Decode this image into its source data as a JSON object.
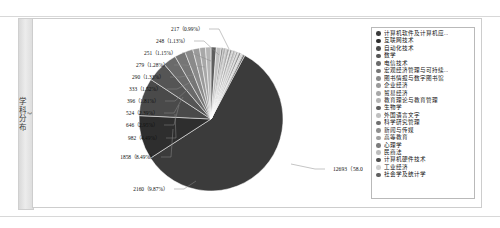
{
  "sidebar": {
    "tab_label": "学科分布",
    "tab_chevrons": "》"
  },
  "chart_data": {
    "type": "pie",
    "title": "",
    "legend_position": "right",
    "label_format": "count (percent)",
    "total": 21882,
    "categories": [
      "计算机软件及计算机应...",
      "互联网技术",
      "自动化技术",
      "数学",
      "电信技术",
      "宏观经济管理与可持续...",
      "图书情报与数字图书馆",
      "企业经济",
      "贸易经济",
      "教育理论与教育管理",
      "生物学",
      "外国语言文字",
      "科学研究管理",
      "新闻与传媒",
      "高等教育",
      "心理学",
      "民商法",
      "计算机硬件技术",
      "工业经济",
      "社会学及统计学"
    ],
    "values": [
      12693,
      2160,
      1858,
      982,
      646,
      524,
      396,
      333,
      290,
      279,
      251,
      248,
      217,
      190,
      170,
      150,
      135,
      120,
      110,
      100
    ],
    "colors": [
      "#3b3b3b",
      "#2e2e2e",
      "#4a4a4a",
      "#555555",
      "#6a6a6a",
      "#767676",
      "#8a8a8a",
      "#9a9a9a",
      "#a8a8a8",
      "#b4b4b4",
      "#5e5e5e",
      "#c0c0c0",
      "#6f6f6f",
      "#8f8f8f",
      "#a0a0a0",
      "#7c7c7c",
      "#bdbdbd",
      "#4f4f4f",
      "#cfcfcf",
      "#606060"
    ],
    "callouts": [
      {
        "count": "217",
        "percent": "0.99%",
        "text": "217（0.99%）"
      },
      {
        "count": "248",
        "percent": "1.13%",
        "text": "248（1.13%）"
      },
      {
        "count": "251",
        "percent": "1.15%",
        "text": "251（1.15%）"
      },
      {
        "count": "279",
        "percent": "1.28%",
        "text": "279（1.28%）"
      },
      {
        "count": "290",
        "percent": "1.33%",
        "text": "290（1.33%）"
      },
      {
        "count": "333",
        "percent": "1.52%",
        "text": "333（1.52%）"
      },
      {
        "count": "396",
        "percent": "1.81%",
        "text": "396（1.81%）"
      },
      {
        "count": "524",
        "percent": "2.39%",
        "text": "524（2.39%）"
      },
      {
        "count": "646",
        "percent": "2.95%",
        "text": "646（2.95%）"
      },
      {
        "count": "982",
        "percent": "4.49%",
        "text": "982（4.49%）"
      },
      {
        "count": "1858",
        "percent": "8.49%",
        "text": "1858（8.49%）"
      },
      {
        "count": "2160",
        "percent": "9.87%",
        "text": "2160（9.87%）"
      },
      {
        "count": "12693",
        "percent": "58.01%",
        "text": "12693（58.01%）"
      }
    ]
  }
}
